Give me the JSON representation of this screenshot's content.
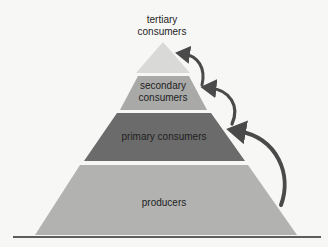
{
  "diagram": {
    "type": "ecological-pyramid",
    "levels": [
      {
        "id": "tertiary",
        "lines": [
          "tertiary",
          "consumers"
        ],
        "fill": "#d9d9d8",
        "label_position": "above-apex"
      },
      {
        "id": "secondary",
        "lines": [
          "secondary",
          "consumers"
        ],
        "fill": "#a9a9a8"
      },
      {
        "id": "primary",
        "lines": [
          "primary consumers"
        ],
        "fill": "#6b6b6b"
      },
      {
        "id": "producers",
        "lines": [
          "producers"
        ],
        "fill": "#b2b2b1"
      }
    ],
    "arrows": [
      {
        "from": "producers",
        "to": "primary",
        "color": "#4a4a4a"
      },
      {
        "from": "primary",
        "to": "secondary",
        "color": "#4a4a4a"
      },
      {
        "from": "secondary",
        "to": "tertiary",
        "color": "#4a4a4a"
      }
    ],
    "ground_line_color": "#2a2a2a"
  }
}
